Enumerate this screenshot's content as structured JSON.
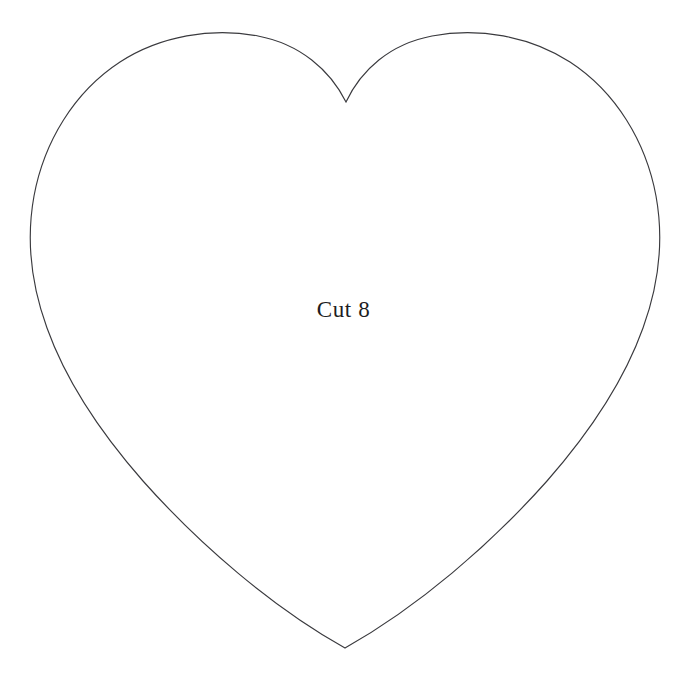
{
  "page": {
    "width": 687,
    "height": 683,
    "background_color": "#ffffff",
    "document_type": "sewing-pattern-template"
  },
  "shape": {
    "name": "heart",
    "outline_color": "#3a3a3e",
    "fill_color": "#ffffff",
    "stroke_width": 1.15,
    "geometry": {
      "top_notch": {
        "x": 346,
        "y": 102
      },
      "left_lobe_apex": {
        "x": 220,
        "y": 50
      },
      "right_lobe_apex": {
        "x": 480,
        "y": 52
      },
      "leftmost_point": {
        "x": 31,
        "y": 245
      },
      "rightmost_point": {
        "x": 658,
        "y": 250
      },
      "bottom_point": {
        "x": 345,
        "y": 648
      }
    },
    "path": "M 346 102 C 330 70 300 44 258 36 C 212 27 160 36 120 62 C 74 92 44 142 34 196 C 26 240 31 284 47 328 C 66 381 100 432 143 481 C 200 545 272 607 345 648 C 418 607 490 545 547 481 C 590 432 624 381 643 328 C 659 284 664 240 656 196 C 646 142 616 92 570 62 C 530 36 478 27 432 36 C 390 44 361 70 346 102 Z"
  },
  "label": {
    "text": "Cut 8",
    "color": "#1d1d22",
    "font_size_px": 23,
    "position": {
      "x": 347,
      "y": 313
    }
  }
}
